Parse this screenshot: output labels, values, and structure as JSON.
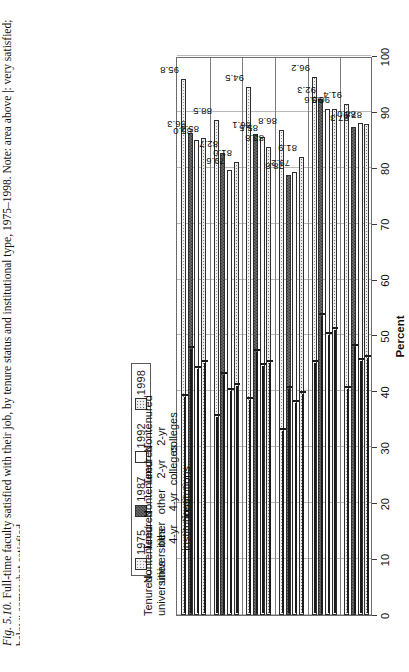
{
  "figure": {
    "caption_prefix": "Fig. 5.10.",
    "caption": " Full-time faculty satisfied with their job, by tenure status and institutional type, 1975–1998. Note: area above |: very satisfied;",
    "caption_line2": "below: somewhat satisfied."
  },
  "legend": {
    "position": "top",
    "items": [
      {
        "label": "1975",
        "swatch": "light-dots-swatch"
      },
      {
        "label": "1987",
        "swatch": "dark-checker-swatch"
      },
      {
        "label": "1992",
        "swatch": "white-swatch"
      },
      {
        "label": "1998",
        "swatch": "medium-dots-swatch"
      }
    ]
  },
  "axis": {
    "title": "Percent",
    "ticks": [
      "0",
      "10",
      "20",
      "30",
      "40",
      "50",
      "60",
      "70",
      "80",
      "90",
      "100"
    ],
    "min": 0,
    "max": 100
  },
  "chart_data": {
    "type": "bar",
    "title": "Full-time faculty satisfied with their job, by tenure status and institutional type, 1975–1998",
    "orientation": "horizontal",
    "xlabel": "Percent",
    "ylabel": "",
    "xlim": [
      0,
      100
    ],
    "grid": true,
    "legend_position": "top",
    "categories": [
      "Tenured universities",
      "Nontenured universities",
      "Tenured other 4-yr institutions",
      "Nontenured other 4-yr institutions",
      "Tenured 2-yr colleges",
      "Nontenured 2-yr colleges"
    ],
    "series": [
      {
        "name": "1975",
        "values": [
          95.8,
          88.5,
          94.5,
          86.8,
          96.2,
          91.4
        ]
      },
      {
        "name": "1987",
        "values": [
          86.3,
          82.7,
          86.1,
          78.8,
          92.3,
          87.3
        ]
      },
      {
        "name": "1992",
        "values": [
          85.0,
          79.6,
          85.5,
          79.2,
          90.6,
          88.0
        ]
      },
      {
        "name": "1998",
        "values": [
          85.4,
          81.0,
          83.8,
          81.9,
          90.5,
          87.9
        ]
      }
    ],
    "very_satisfied_marks": [
      {
        "name": "1975",
        "values": [
          39.0,
          35.5,
          38.5,
          33.0,
          45.0,
          40.5
        ]
      },
      {
        "name": "1987",
        "values": [
          47.5,
          43.0,
          47.0,
          40.5,
          53.5,
          48.0
        ]
      },
      {
        "name": "1992",
        "values": [
          44.0,
          40.0,
          44.5,
          38.0,
          50.0,
          45.5
        ]
      },
      {
        "name": "1998",
        "values": [
          45.0,
          41.0,
          45.0,
          39.5,
          51.0,
          46.0
        ]
      }
    ],
    "annotations": "area above | : very satisfied; below: somewhat satisfied"
  }
}
